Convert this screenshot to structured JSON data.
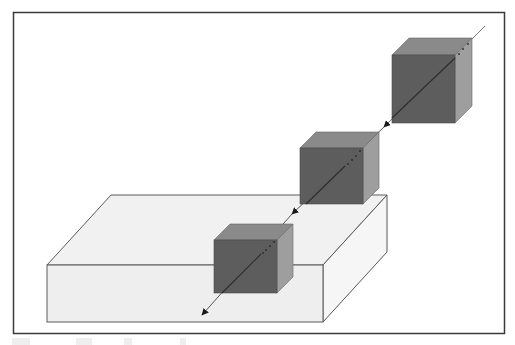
{
  "figure": {
    "colors": {
      "frame": "#3a3a3a",
      "slab_front": "#eeeeee",
      "slab_top": "#f1f1f1",
      "slab_side": "#f6f6f6",
      "slab_edge": "#5a5a5a",
      "cube_front": "#5d5d5d",
      "cube_top": "#8a8a8a",
      "cube_side": "#9e9e9e",
      "line": "#333333"
    },
    "objects": [
      {
        "name": "slab",
        "kind": "rectangular-block"
      },
      {
        "name": "cube-1",
        "kind": "cube",
        "position": "upper-right"
      },
      {
        "name": "cube-2",
        "kind": "cube",
        "position": "middle"
      },
      {
        "name": "cube-3",
        "kind": "cube",
        "position": "on-slab"
      },
      {
        "name": "axis-line",
        "kind": "arrowed-line",
        "arrowheads": 3,
        "direction": "down-left"
      }
    ]
  }
}
